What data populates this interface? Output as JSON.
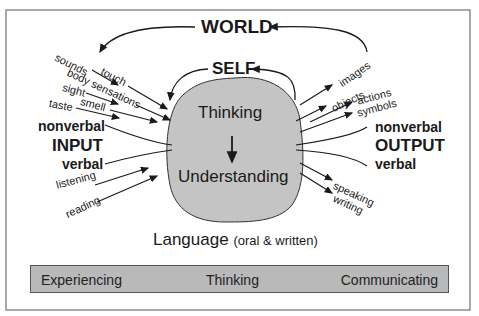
{
  "diagram": {
    "top_labels": {
      "world": "WORLD",
      "self": "SELF"
    },
    "center": {
      "thinking": "Thinking",
      "understanding": "Understanding"
    },
    "input": {
      "title": "INPUT",
      "nonverbal": "nonverbal",
      "verbal": "verbal",
      "nonverbal_items": [
        "sounds",
        "touch",
        "body sensations",
        "sight",
        "smell",
        "taste"
      ],
      "verbal_items": [
        "listening",
        "reading"
      ]
    },
    "output": {
      "title": "OUTPUT",
      "nonverbal": "nonverbal",
      "verbal": "verbal",
      "nonverbal_items": [
        "images",
        "objects",
        "actions",
        "symbols"
      ],
      "verbal_items": [
        "speaking",
        "writing"
      ]
    },
    "language_label": "Language",
    "language_sub": "(oral & written)",
    "bottom_bar": [
      "Experiencing",
      "Thinking",
      "Communicating"
    ],
    "colors": {
      "blob": "#c4c4c4",
      "bar": "#b9b9b9",
      "ink": "#1a1a1a",
      "frame": "#555555"
    }
  }
}
